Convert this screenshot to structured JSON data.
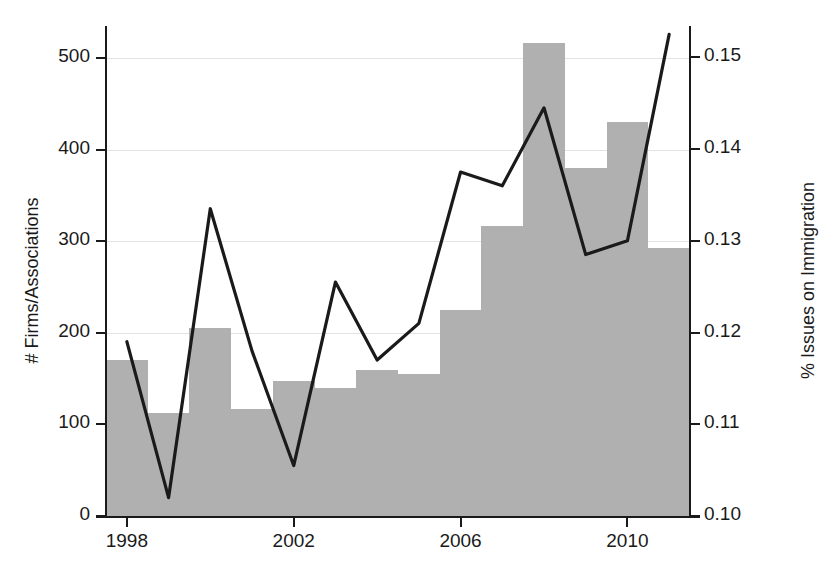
{
  "chart_data": {
    "type": "bar",
    "title": "",
    "subtitle": "",
    "xlabel": "",
    "ylabel": "# Firms/Associations",
    "ylabel_right": "% Issues on Immigration",
    "grid": true,
    "legend": "none",
    "x": [
      1998,
      1999,
      2000,
      2001,
      2002,
      2003,
      2004,
      2005,
      2006,
      2007,
      2008,
      2009,
      2010,
      2011
    ],
    "categories": [
      "1998",
      "1999",
      "2000",
      "2001",
      "2002",
      "2003",
      "2004",
      "2005",
      "2006",
      "2007",
      "2008",
      "2009",
      "2010",
      "2011"
    ],
    "xlim": [
      1997.5,
      2011.5
    ],
    "ylim": [
      0,
      533
    ],
    "ylim_right": [
      0.1,
      0.1532
    ],
    "xticks": [
      1998,
      2002,
      2006,
      2010
    ],
    "xticklabels": [
      "1998",
      "2002",
      "2006",
      "2010"
    ],
    "yticks": [
      0,
      100,
      200,
      300,
      400,
      500
    ],
    "yticklabels": [
      "0",
      "100",
      "200",
      "300",
      "400",
      "500"
    ],
    "yticks_right": [
      0.1,
      0.11,
      0.12,
      0.13,
      0.14,
      0.15
    ],
    "yticklabels_right": [
      "0.10",
      "0.11",
      "0.12",
      "0.13",
      "0.14",
      "0.15"
    ],
    "series": [
      {
        "name": "# Firms/Associations",
        "type": "bar",
        "axis": "left",
        "color": "#b0b0b0",
        "values": [
          170,
          112,
          205,
          117,
          148,
          140,
          160,
          155,
          225,
          317,
          517,
          380,
          430,
          293
        ]
      },
      {
        "name": "% Issues on Immigration",
        "type": "line",
        "axis": "right",
        "color": "#1a1a1a",
        "values": [
          0.119,
          0.102,
          0.1335,
          0.118,
          0.1055,
          0.1255,
          0.117,
          0.121,
          0.1375,
          0.136,
          0.1445,
          0.1285,
          0.13,
          0.1525
        ]
      }
    ]
  },
  "axes": {
    "left_title": "# Firms/Associations",
    "right_title": "% Issues on Immigration"
  }
}
